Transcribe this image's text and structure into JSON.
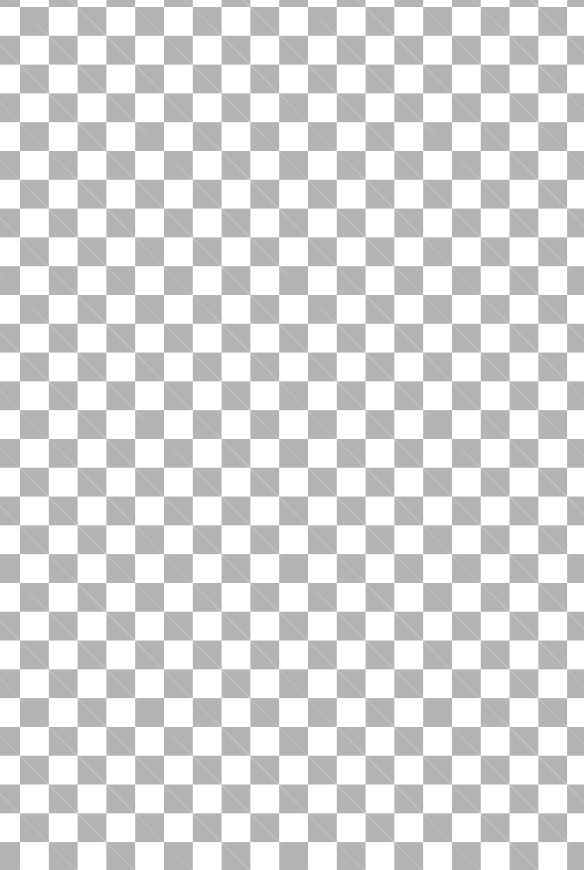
{
  "canvas": {
    "description": "transparency checkerboard",
    "square_size_px": 28.8,
    "colors": {
      "light": "#ffffff",
      "dark": "#b4b4b4"
    }
  }
}
